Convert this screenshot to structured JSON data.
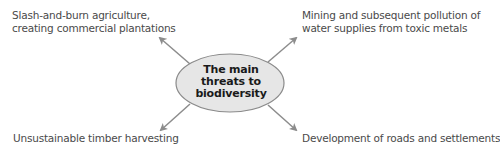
{
  "diagram": {
    "center": {
      "lines": [
        "The main",
        "threats to",
        "biodiversity"
      ],
      "fill": "#e6e6e6",
      "stroke": "#8a8a8a"
    },
    "arrow_color": "#8c8c8c",
    "threats": [
      {
        "position": "top-left",
        "lines": [
          "Slash-and-burn agriculture,",
          "creating commercial plantations"
        ]
      },
      {
        "position": "top-right",
        "lines": [
          "Mining and subsequent pollution of",
          "water supplies from toxic metals"
        ]
      },
      {
        "position": "bottom-left",
        "lines": [
          "Unsustainable timber harvesting"
        ]
      },
      {
        "position": "bottom-right",
        "lines": [
          "Development of roads and settlements"
        ]
      }
    ]
  }
}
